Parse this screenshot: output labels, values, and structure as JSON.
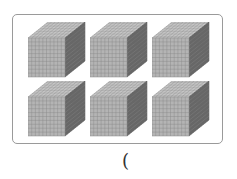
{
  "figure": {
    "cube_count": 6,
    "rows": 2,
    "columns": 3,
    "cube_grid_divisions": 10,
    "colors": {
      "front": "#b4b4b4",
      "top": "#cfcfcf",
      "side": "#6e6e6e",
      "grid": "#8a8a8a",
      "border": "#9a9a9a"
    }
  },
  "answer": {
    "open_paren": "("
  }
}
